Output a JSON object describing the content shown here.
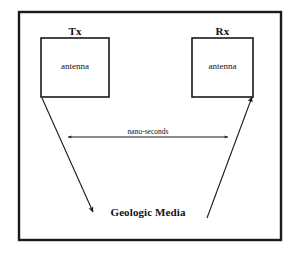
{
  "figure": {
    "background_color": "#ffffff",
    "line_color": "#1a1a1a"
  },
  "frame": {
    "name": "outer-frame",
    "x": 19,
    "y": 12,
    "width": 262,
    "height": 228,
    "stroke_width": 2.4
  },
  "transmitter": {
    "label": "Tx",
    "inner_label": "antenna",
    "box": {
      "x": 41,
      "y": 38,
      "width": 68,
      "height": 59
    }
  },
  "receiver": {
    "label": "Rx",
    "inner_label": "antenna",
    "box": {
      "x": 192,
      "y": 38,
      "width": 61,
      "height": 59
    }
  },
  "timing_arrow": {
    "label": "nano-seconds",
    "left_tip_x": 68,
    "right_tip_x": 228,
    "y": 137,
    "double_headed": true
  },
  "transmit_ray": {
    "name": "transmit-ray",
    "from_x": 42,
    "from_y": 98,
    "to_x": 93,
    "to_y": 212,
    "arrowhead": "end"
  },
  "receive_ray": {
    "name": "receive-ray",
    "from_x": 207,
    "from_y": 218,
    "to_x": 252,
    "to_y": 97,
    "arrowhead": "end"
  },
  "medium": {
    "label": "Geologic Media"
  }
}
